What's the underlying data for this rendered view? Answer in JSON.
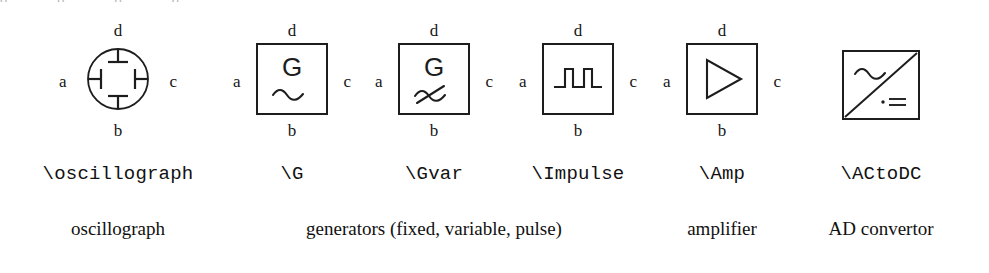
{
  "page": {
    "background": "#ffffff",
    "ink": "#1a1a1a",
    "clipped_top_artifact": [
      "d",
      "d",
      "d",
      "d"
    ]
  },
  "terminal_labels": {
    "top": "d",
    "bottom": "b",
    "left": "a",
    "right": "c"
  },
  "symbols": [
    {
      "key": "oscillograph",
      "shape": "circle",
      "inner": "four-terminal-bars",
      "center_x": 118,
      "command": "\\oscillograph",
      "command_x": 118,
      "has_terminals": true,
      "glyph_name": "oscillograph-circle-icon"
    },
    {
      "key": "G",
      "shape": "square",
      "inner": "letter-G-plus-sine",
      "letter": "G",
      "center_x": 292,
      "command": "\\G",
      "command_x": 292,
      "has_terminals": true,
      "glyph_name": "generator-fixed-icon"
    },
    {
      "key": "Gvar",
      "shape": "square",
      "inner": "letter-G-plus-sine-with-slash",
      "letter": "G",
      "center_x": 434,
      "command": "\\Gvar",
      "command_x": 434,
      "has_terminals": true,
      "glyph_name": "generator-variable-icon"
    },
    {
      "key": "Impulse",
      "shape": "square",
      "inner": "two-square-pulses",
      "center_x": 578,
      "command": "\\Impulse",
      "command_x": 578,
      "has_terminals": true,
      "glyph_name": "generator-pulse-icon"
    },
    {
      "key": "Amp",
      "shape": "square",
      "inner": "right-pointing-triangle",
      "center_x": 722,
      "command": "\\Amp",
      "command_x": 722,
      "has_terminals": true,
      "glyph_name": "amplifier-triangle-icon"
    },
    {
      "key": "ACtoDC",
      "shape": "square",
      "inner": "diagonal-with-sine-and-dc",
      "center_x": 881,
      "command": "\\ACtoDC",
      "command_x": 881,
      "has_terminals": false,
      "glyph_name": "ac-to-dc-converter-icon"
    }
  ],
  "descriptions": [
    {
      "text": "oscillograph",
      "center_x": 118
    },
    {
      "text": "generators (fixed, variable, pulse)",
      "center_x": 434
    },
    {
      "text": "amplifier",
      "center_x": 722
    },
    {
      "text": "AD convertor",
      "center_x": 881
    }
  ]
}
